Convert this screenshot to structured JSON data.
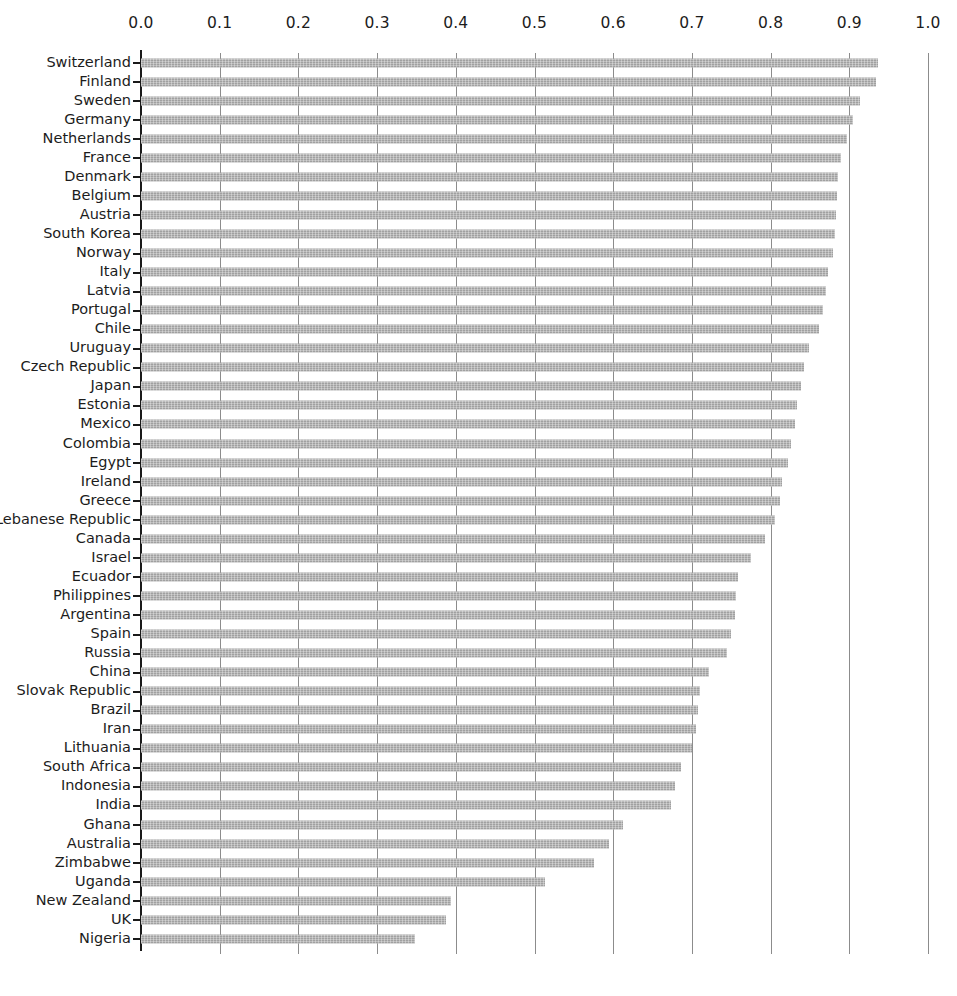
{
  "chart_data": {
    "type": "bar",
    "orientation": "horizontal",
    "title": "",
    "subtitle": "",
    "xlabel": "",
    "ylabel": "",
    "xlim": [
      0.0,
      1.0
    ],
    "grid": true,
    "legend": null,
    "bar_color": "#a9a9a9",
    "axis_color": "#1a1a1a",
    "gridline_color": "#8c8c8c",
    "xticks": [
      "0.0",
      "0.1",
      "0.2",
      "0.3",
      "0.4",
      "0.5",
      "0.6",
      "0.7",
      "0.8",
      "0.9",
      "1.0"
    ],
    "xtick_values": [
      0.0,
      0.1,
      0.2,
      0.3,
      0.4,
      0.5,
      0.6,
      0.7,
      0.8,
      0.9,
      1.0
    ],
    "categories": [
      "Switzerland",
      "Finland",
      "Sweden",
      "Germany",
      "Netherlands",
      "France",
      "Denmark",
      "Belgium",
      "Austria",
      "South Korea",
      "Norway",
      "Italy",
      "Latvia",
      "Portugal",
      "Chile",
      "Uruguay",
      "Czech Republic",
      "Japan",
      "Estonia",
      "Mexico",
      "Colombia",
      "Egypt",
      "Ireland",
      "Greece",
      "Lebanese Republic",
      "Canada",
      "Israel",
      "Ecuador",
      "Philippines",
      "Argentina",
      "Spain",
      "Russia",
      "China",
      "Slovak Republic",
      "Brazil",
      "Iran",
      "Lithuania",
      "South Africa",
      "Indonesia",
      "India",
      "Ghana",
      "Australia",
      "Zimbabwe",
      "Uganda",
      "New Zealand",
      "UK",
      "Nigeria"
    ],
    "values": [
      0.937,
      0.934,
      0.913,
      0.905,
      0.897,
      0.89,
      0.886,
      0.884,
      0.883,
      0.882,
      0.879,
      0.873,
      0.871,
      0.866,
      0.862,
      0.849,
      0.843,
      0.838,
      0.834,
      0.831,
      0.826,
      0.822,
      0.815,
      0.812,
      0.805,
      0.793,
      0.775,
      0.758,
      0.756,
      0.755,
      0.75,
      0.745,
      0.722,
      0.71,
      0.708,
      0.705,
      0.7,
      0.686,
      0.679,
      0.673,
      0.612,
      0.595,
      0.575,
      0.513,
      0.394,
      0.388,
      0.348
    ]
  }
}
